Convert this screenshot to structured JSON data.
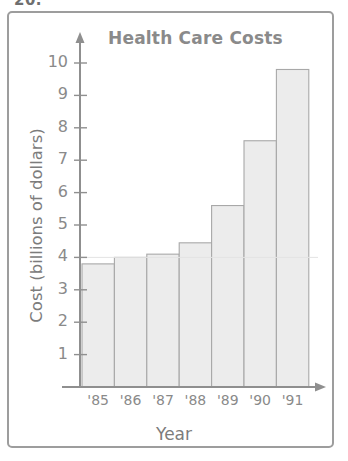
{
  "problem_number": "20.",
  "figure": {
    "frame": true
  },
  "chart_data": {
    "type": "bar",
    "title": "Health Care Costs",
    "xlabel": "Year",
    "ylabel": "Cost (billions of dollars)",
    "categories": [
      "'85",
      "'86",
      "'87",
      "'88",
      "'89",
      "'90",
      "'91"
    ],
    "values": [
      3.8,
      4.0,
      4.1,
      4.45,
      5.6,
      7.6,
      9.8
    ],
    "ylim": [
      0,
      10.6
    ],
    "y_ticks": [
      1,
      2,
      3,
      4,
      5,
      6,
      7,
      8,
      9,
      10
    ],
    "y_tick_labels": [
      "1",
      "2",
      "3",
      "4",
      "5",
      "6",
      "7",
      "8",
      "9",
      "10"
    ],
    "grid": false,
    "legend": null,
    "colors": {
      "bar_fill": "#ececec",
      "bar_stroke": "#a8a8a8",
      "axis": "#8f8f8f",
      "text": "#8a8a8a",
      "frame": "#9d9d9d"
    }
  }
}
